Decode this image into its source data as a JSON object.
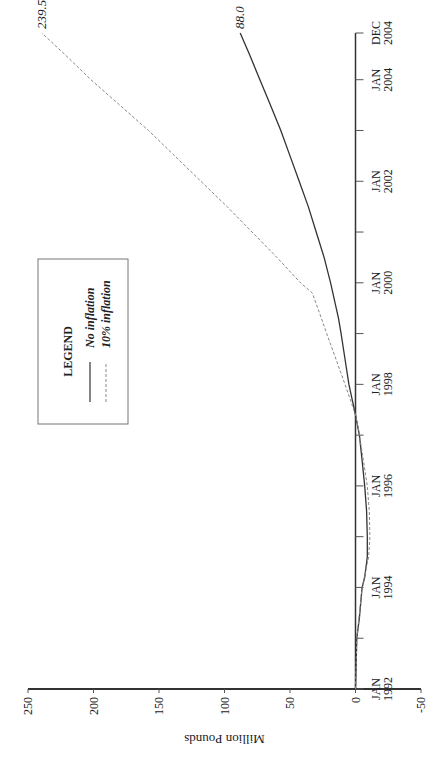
{
  "chart_data": {
    "type": "line",
    "title": "",
    "xlabel": "",
    "ylabel": "Million Pounds",
    "ylim": [
      -50,
      250
    ],
    "yticks": [
      -50,
      0,
      50,
      100,
      150,
      200,
      250
    ],
    "ytick_labels": [
      "-50",
      "0",
      "50",
      "100",
      "150",
      "200",
      "250"
    ],
    "xlim": [
      1992.0,
      2004.92
    ],
    "xticks": [
      {
        "t": 1992.0,
        "label": [
          "JAN",
          "1992"
        ]
      },
      {
        "t": 1993.0,
        "label": null
      },
      {
        "t": 1994.0,
        "label": [
          "JAN",
          "1994"
        ]
      },
      {
        "t": 1995.0,
        "label": null
      },
      {
        "t": 1996.0,
        "label": [
          "JAN",
          "1996"
        ]
      },
      {
        "t": 1997.0,
        "label": null
      },
      {
        "t": 1998.0,
        "label": [
          "JAN",
          "1998"
        ]
      },
      {
        "t": 1999.0,
        "label": null
      },
      {
        "t": 2000.0,
        "label": [
          "JAN",
          "2000"
        ]
      },
      {
        "t": 2001.0,
        "label": null
      },
      {
        "t": 2002.0,
        "label": [
          "JAN",
          "2002"
        ]
      },
      {
        "t": 2003.0,
        "label": null
      },
      {
        "t": 2004.0,
        "label": [
          "JAN",
          "2004"
        ]
      },
      {
        "t": 2004.92,
        "label": [
          "DEC",
          "2004"
        ]
      }
    ],
    "grid": false,
    "legend": {
      "title": "LEGEND",
      "position": "upper-left",
      "entries": [
        {
          "name": "No inflation",
          "style": "solid"
        },
        {
          "name": "10% inflation",
          "style": "dashed"
        }
      ]
    },
    "series": [
      {
        "name": "No inflation",
        "style": "solid",
        "color": "#333333",
        "end_label": "88.0",
        "x": [
          1992.0,
          1993.0,
          1993.4,
          1994.0,
          1994.2,
          1994.6,
          1995.0,
          1995.5,
          1996.0,
          1996.5,
          1997.0,
          1997.4,
          1998.0,
          1998.5,
          1999.0,
          1999.3,
          2000.0,
          2000.5,
          2001.0,
          2001.5,
          2002.0,
          2002.5,
          2003.0,
          2003.5,
          2004.0,
          2004.5,
          2004.92
        ],
        "y": [
          0,
          -1,
          -3,
          -5,
          -7,
          -9,
          -9,
          -8.5,
          -7,
          -5,
          -3,
          0,
          5,
          8,
          11,
          13,
          19,
          24,
          30,
          36,
          43,
          50,
          57,
          65,
          73,
          81,
          88.0
        ]
      },
      {
        "name": "10% inflation",
        "style": "dashed",
        "color": "#888888",
        "end_label": "239.5",
        "x": [
          1992.0,
          1993.0,
          1994.0,
          1994.6,
          1995.0,
          1995.5,
          1996.0,
          1996.5,
          1997.0,
          1997.4,
          1998.0,
          1998.5,
          1999.0,
          1999.3,
          1999.8,
          2000.0,
          2000.5,
          2001.0,
          2001.5,
          2002.0,
          2002.5,
          2003.0,
          2003.5,
          2004.0,
          2004.5,
          2004.92
        ],
        "y": [
          0,
          -1,
          -5,
          -10,
          -11,
          -10.5,
          -9,
          -6,
          -3,
          0,
          8,
          15,
          22,
          26,
          33,
          42,
          60,
          79,
          98,
          118,
          138,
          158,
          180,
          202,
          222,
          239.5
        ]
      }
    ]
  }
}
